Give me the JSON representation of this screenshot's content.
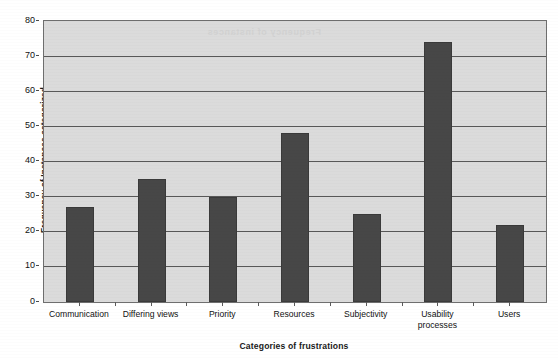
{
  "chart_data": {
    "type": "bar",
    "title": "",
    "xlabel": "Categories of frustrations",
    "ylabel": "Frequency of Instances categorized",
    "categories": [
      "Communication",
      "Differing views",
      "Priority",
      "Resources",
      "Subjectivity",
      "Usability\nprocesses",
      "Users"
    ],
    "values": [
      27,
      35,
      30,
      48,
      25,
      74,
      22
    ],
    "ylim": [
      0,
      80
    ],
    "ytick_labels": [
      "0",
      "10",
      "20",
      "30",
      "40",
      "50",
      "60",
      "70",
      "80"
    ],
    "ytick_values": [
      0,
      10,
      20,
      30,
      40,
      50,
      60,
      70,
      80
    ],
    "grid": "horizontal",
    "legend": "none",
    "colors": {
      "bar_fill": "#474747",
      "bar_border": "#3a3a3a",
      "plot_background": "#dbdbdb",
      "gridline": "#585858",
      "axis_border": "#6e6e6e",
      "text": "#111111",
      "ghost_text": "#d2d2d2"
    }
  },
  "artifacts": {
    "ghost_text": "Frequency of instances"
  }
}
